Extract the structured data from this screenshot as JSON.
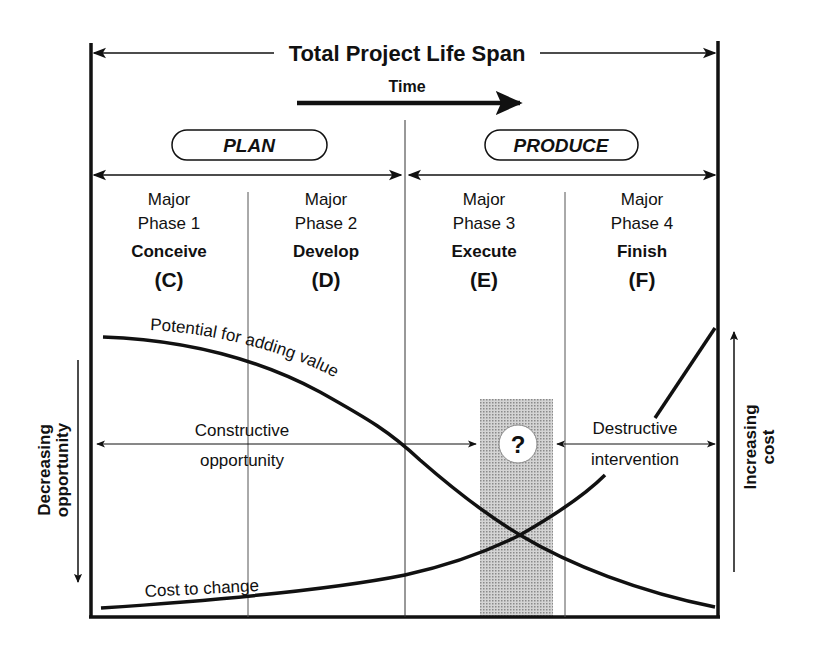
{
  "title": "Total Project Life Span",
  "time_label": "Time",
  "stages": [
    {
      "label": "PLAN"
    },
    {
      "label": "PRODUCE"
    }
  ],
  "phases": [
    {
      "major": "Major",
      "phase": "Phase 1",
      "name": "Conceive",
      "code": "(C)"
    },
    {
      "major": "Major",
      "phase": "Phase 2",
      "name": "Develop",
      "code": "(D)"
    },
    {
      "major": "Major",
      "phase": "Phase 3",
      "name": "Execute",
      "code": "(E)"
    },
    {
      "major": "Major",
      "phase": "Phase 4",
      "name": "Finish",
      "code": "(F)"
    }
  ],
  "curves": {
    "value_label": "Potential for adding value",
    "cost_label": "Cost to change"
  },
  "regions": {
    "constructive_line1": "Constructive",
    "constructive_line2": "opportunity",
    "destructive_line1": "Destructive",
    "destructive_line2": "intervention",
    "uncertainty_symbol": "?"
  },
  "axes": {
    "left_line1": "Decreasing",
    "left_line2": "opportunity",
    "right_line1": "Increasing",
    "right_line2": "cost"
  },
  "colors": {
    "ink": "#111111",
    "shade": "#b8b8b8",
    "background": "#ffffff"
  }
}
